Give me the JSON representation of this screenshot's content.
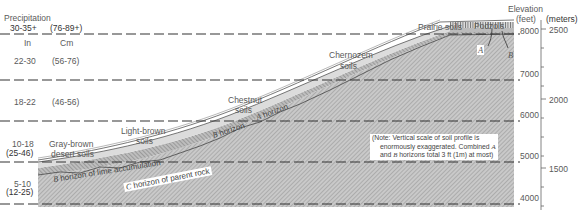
{
  "precipitation": {
    "title": "Precipitation",
    "unit_in": "In",
    "unit_cm": "Cm",
    "bands": [
      {
        "inches": "30-35+",
        "cm": "(76-89+)"
      },
      {
        "inches": "22-30",
        "cm": "(56-76)"
      },
      {
        "inches": "18-22",
        "cm": "(46-56)"
      },
      {
        "inches": "10-18",
        "cm": "(25-46)"
      },
      {
        "inches": "5-10",
        "cm": "(12-25)"
      }
    ]
  },
  "soils": {
    "gray_brown_1": "Gray-brown",
    "gray_brown_2": "desert soils",
    "light_brown_1": "Light-brown",
    "light_brown_2": "soils",
    "chestnut_1": "Chestnut",
    "chestnut_2": "soils",
    "chernozem_1": "Chernozem",
    "chernozem_2": "soils",
    "prairie": "Prairie soils",
    "podzols": "Podzols"
  },
  "horizons": {
    "b_lime_letter": "B",
    "b_lime": "horizon of lime accumulation",
    "c_letter": "C",
    "c_parent": "horizon of parent rock",
    "b_letter": "B",
    "b_horizon": "horizon",
    "a_letter": "A",
    "a_horizon": "horizon",
    "podzol_a": "A",
    "podzol_b": "B"
  },
  "elevation": {
    "title_1": "Elevation",
    "title_2": "(feet)",
    "meters_title": "(meters)",
    "feet_ticks": [
      "8000",
      "7000",
      "6000",
      "5000",
      "4000"
    ],
    "meter_ticks": [
      "2500",
      "2000",
      "1500"
    ]
  },
  "note": {
    "line1": "(Note: Vertical scale of soil profile is",
    "line2_a": "enormously exaggerated. Combined ",
    "line2_b": "A",
    "line3_a": "and ",
    "line3_b": "B",
    "line3_c": " horizons total 3 ft (1m) at most)"
  }
}
